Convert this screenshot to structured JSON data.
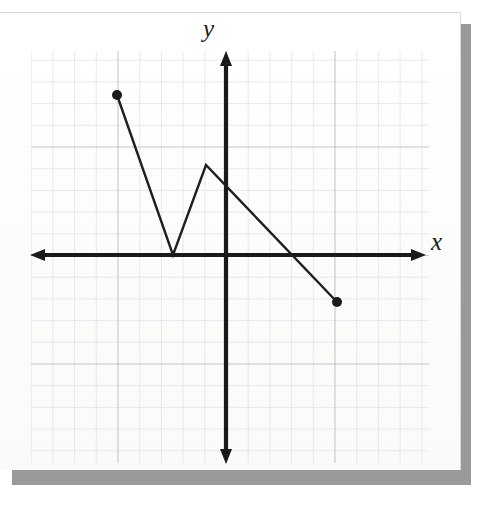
{
  "figure": {
    "kind": "graph-paper-sheet",
    "paper_color": "#fdfdfd",
    "shadow_color": "#9a9a9a",
    "grid_minor_color": "#c9ccd1",
    "grid_major_color": "#9fa4ab",
    "axis_color": "#1a1a1a",
    "curve_color": "#1f1f1f"
  },
  "axes": {
    "x_label": "x",
    "y_label": "y",
    "x_label_icon": "x-axis-label",
    "y_label_icon": "y-axis-label",
    "origin_px": {
      "x": 226,
      "y": 255
    },
    "grid_spacing_px": 21.7,
    "x_axis_px": {
      "x1": 30,
      "x2": 426,
      "y": 255
    },
    "y_axis_px": {
      "y1": 51,
      "y2": 464,
      "x": 226
    },
    "arrowheads": [
      "left",
      "right",
      "up",
      "down"
    ]
  },
  "chart_data": {
    "type": "line",
    "title": "",
    "xlabel": "x",
    "ylabel": "y",
    "grid": true,
    "legend": null,
    "xlim": [
      -9,
      9.2
    ],
    "ylim": [
      -9.4,
      9.4
    ],
    "series": [
      {
        "name": "piecewise-linear-function",
        "closed_endpoints": [
          [
            -5,
            7.4
          ],
          [
            5.1,
            -2.2
          ]
        ],
        "x": [
          -5,
          -2.4,
          -0.9,
          5.1
        ],
        "y": [
          7.4,
          0,
          4.1,
          -2.2
        ],
        "points_px": [
          {
            "x": 117,
            "y": 95
          },
          {
            "x": 173,
            "y": 255
          },
          {
            "x": 206,
            "y": 165
          },
          {
            "x": 337,
            "y": 302
          }
        ],
        "vertices": [
          {
            "label": "left-endpoint",
            "x": -5,
            "y": 7.4,
            "marker": "filled-dot"
          },
          {
            "label": "valley-vertex-on-x-axis",
            "x": -2.4,
            "y": 0,
            "marker": "none"
          },
          {
            "label": "peak-vertex",
            "x": -0.9,
            "y": 4.1,
            "marker": "none"
          },
          {
            "label": "right-endpoint",
            "x": 5.1,
            "y": -2.2,
            "marker": "filled-dot"
          }
        ]
      }
    ]
  }
}
